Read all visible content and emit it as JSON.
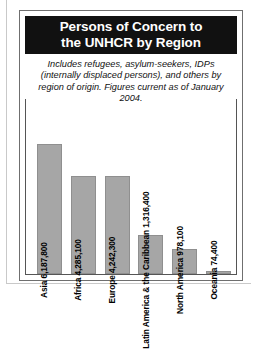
{
  "figure": {
    "title": "Persons of Concern to\nthe UNHCR by Region",
    "subtitle": "Includes refugees, asylum-seekers, IDPs (internally displaced persons), and others by region of origin. Figures current as of January 2004."
  },
  "chart_data": {
    "type": "bar",
    "title": "Persons of Concern to the UNHCR by Region",
    "subtitle": "Includes refugees, asylum-seekers, IDPs (internally displaced persons), and others by region of origin. Figures current as of January 2004.",
    "xlabel": "",
    "ylabel": "",
    "grid": false,
    "legend": null,
    "ylim": [
      0,
      6500000
    ],
    "categories": [
      "Asia",
      "Africa",
      "Europe",
      "Latin America & the Caribbean",
      "North America",
      "Oceania"
    ],
    "values": [
      6187800,
      4285100,
      4242300,
      1316400,
      978100,
      74400
    ],
    "value_labels": [
      "6,187,800",
      "4,285,100",
      "4,242,300",
      "1,316,400",
      "978,100",
      "74,400"
    ],
    "bar_labels": [
      "Asia 6,187,800",
      "Africa 4,285,100",
      "Europe 4,242,300",
      "Latin America & the Caribbean 1,316,400",
      "North America 978,100",
      "Oceania 74,400"
    ],
    "bar_color": "#a6a6a6",
    "label_color": "#000000",
    "bars": [
      {
        "category": "Asia",
        "label": "Asia 6,187,800",
        "value": 6187800,
        "height_pct": 74
      },
      {
        "category": "Africa",
        "label": "Africa 4,285,100",
        "value": 4285100,
        "height_pct": 56
      },
      {
        "category": "Europe",
        "label": "Europe 4,242,300",
        "value": 4242300,
        "height_pct": 56
      },
      {
        "category": "Latin America & the Caribbean",
        "label": "Latin America & the Caribbean 1,316,400",
        "value": 1316400,
        "height_pct": 22
      },
      {
        "category": "North America",
        "label": "North America 978,100",
        "value": 978100,
        "height_pct": 14
      },
      {
        "category": "Oceania",
        "label": "Oceania 74,400",
        "value": 74400,
        "height_pct": 1.5
      }
    ]
  }
}
